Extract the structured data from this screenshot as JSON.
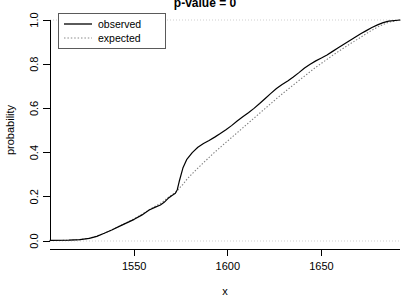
{
  "chart_data": {
    "type": "line",
    "title": "p-value = 0",
    "xlabel": "x",
    "ylabel": "probability",
    "xlim": [
      1505,
      1692
    ],
    "ylim": [
      0.0,
      1.0
    ],
    "xticks": [
      1550,
      1600,
      1650
    ],
    "xtick_labels": [
      "1550",
      "1600",
      "1650"
    ],
    "yticks": [
      0.0,
      0.2,
      0.4,
      0.6,
      0.8,
      1.0
    ],
    "ytick_labels": [
      "0.0",
      "0.2",
      "0.4",
      "0.6",
      "0.8",
      "1.0"
    ],
    "grid": true,
    "gridlines_y": [
      0.0,
      1.0
    ],
    "legend_position": "top-left",
    "legend": [
      "observed",
      "expected"
    ],
    "colors": {
      "observed": "#000000",
      "expected": "#808080",
      "grid": "#cfcfcf",
      "axis": "#000000",
      "background": "#ffffff"
    },
    "series": [
      {
        "name": "observed",
        "style": "solid",
        "x": [
          1505,
          1515,
          1521,
          1526,
          1530,
          1534,
          1538,
          1542,
          1546,
          1550,
          1554,
          1558,
          1561,
          1564,
          1566,
          1568,
          1570,
          1572,
          1573,
          1574,
          1576,
          1578,
          1581,
          1584,
          1587,
          1590,
          1593,
          1596,
          1599,
          1602,
          1605,
          1608,
          1611,
          1614,
          1617,
          1620,
          1623,
          1626,
          1629,
          1632,
          1635,
          1638,
          1641,
          1644,
          1647,
          1650,
          1653,
          1656,
          1659,
          1662,
          1665,
          1668,
          1671,
          1674,
          1677,
          1680,
          1683,
          1686,
          1692
        ],
        "y": [
          0.003,
          0.004,
          0.006,
          0.012,
          0.021,
          0.035,
          0.05,
          0.066,
          0.082,
          0.098,
          0.117,
          0.14,
          0.152,
          0.163,
          0.175,
          0.192,
          0.205,
          0.216,
          0.232,
          0.268,
          0.33,
          0.368,
          0.4,
          0.424,
          0.441,
          0.455,
          0.47,
          0.486,
          0.503,
          0.522,
          0.543,
          0.562,
          0.58,
          0.6,
          0.622,
          0.645,
          0.668,
          0.69,
          0.708,
          0.724,
          0.742,
          0.762,
          0.783,
          0.8,
          0.815,
          0.828,
          0.842,
          0.858,
          0.874,
          0.89,
          0.906,
          0.922,
          0.938,
          0.952,
          0.966,
          0.978,
          0.988,
          0.995,
          1.0
        ]
      },
      {
        "name": "expected",
        "style": "dotted",
        "x": [
          1505,
          1515,
          1521,
          1526,
          1530,
          1534,
          1538,
          1542,
          1546,
          1550,
          1554,
          1558,
          1561,
          1564,
          1566,
          1568,
          1570,
          1572,
          1573,
          1574,
          1576,
          1578,
          1581,
          1584,
          1587,
          1590,
          1593,
          1596,
          1599,
          1602,
          1605,
          1608,
          1611,
          1614,
          1617,
          1620,
          1623,
          1626,
          1629,
          1632,
          1635,
          1638,
          1641,
          1644,
          1647,
          1650,
          1653,
          1656,
          1659,
          1662,
          1665,
          1668,
          1671,
          1674,
          1677,
          1680,
          1683,
          1686,
          1692
        ],
        "y": [
          0.002,
          0.003,
          0.006,
          0.013,
          0.022,
          0.035,
          0.05,
          0.067,
          0.084,
          0.101,
          0.12,
          0.142,
          0.156,
          0.17,
          0.182,
          0.196,
          0.208,
          0.22,
          0.228,
          0.238,
          0.256,
          0.278,
          0.305,
          0.33,
          0.354,
          0.378,
          0.402,
          0.424,
          0.446,
          0.468,
          0.49,
          0.512,
          0.534,
          0.556,
          0.578,
          0.6,
          0.622,
          0.644,
          0.665,
          0.686,
          0.706,
          0.726,
          0.746,
          0.766,
          0.786,
          0.804,
          0.822,
          0.84,
          0.857,
          0.874,
          0.89,
          0.906,
          0.922,
          0.938,
          0.954,
          0.968,
          0.98,
          0.99,
          1.0
        ]
      }
    ]
  }
}
